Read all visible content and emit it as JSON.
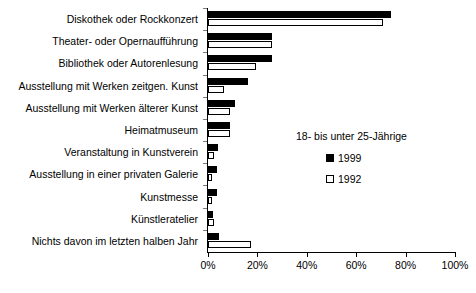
{
  "chart_data": {
    "type": "bar",
    "orientation": "horizontal",
    "title": "",
    "subtitle": "",
    "xlabel": "",
    "ylabel": "",
    "xlim": [
      0,
      100
    ],
    "xticks": [
      0,
      20,
      40,
      60,
      80,
      100
    ],
    "xtick_labels": [
      "0%",
      "20%",
      "40%",
      "60%",
      "80%",
      "100%"
    ],
    "grid": false,
    "legend_position": "middle-right",
    "legend_title": "18- bis unter 25-Jährige",
    "categories": [
      "Diskothek oder Rockkonzert",
      "Theater- oder Opernaufführung",
      "Bibliothek oder Autorenlesung",
      "Ausstellung mit Werken zeitgen. Kunst",
      "Ausstellung mit Werken älterer Kunst",
      "Heimatmuseum",
      "Veranstaltung in Kunstverein",
      "Ausstellung in einer privaten Galerie",
      "Kunstmesse",
      "Künstleratelier",
      "Nichts davon im letzten halben Jahr"
    ],
    "series": [
      {
        "name": "1999",
        "color": "#000000",
        "style": "filled",
        "values": [
          74,
          26,
          26,
          16,
          11,
          9,
          4,
          3.5,
          3.5,
          2,
          4.5
        ]
      },
      {
        "name": "1992",
        "color": "#ffffff",
        "style": "hollow",
        "values": [
          71,
          26,
          19.5,
          6.5,
          9,
          9,
          2.5,
          1.5,
          1.5,
          2.5,
          17.5
        ]
      }
    ]
  }
}
